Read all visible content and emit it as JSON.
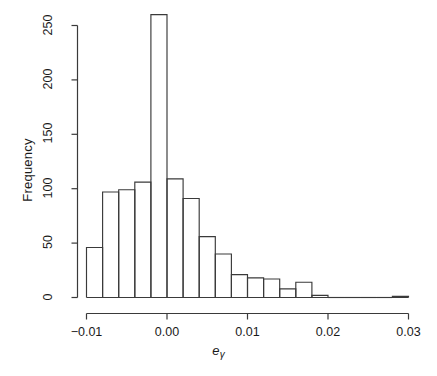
{
  "figure": {
    "background": "#ffffff",
    "ink_color": "#3a3a3a",
    "text_color": "#1a1a1a"
  },
  "axis": {
    "y_label": "Frequency",
    "x_label_base": "e",
    "x_label_sub": "γ",
    "y_ticks": [
      "0",
      "50",
      "100",
      "150",
      "200",
      "250"
    ],
    "x_ticks": [
      "-0.01",
      "0.00",
      "0.01",
      "0.02",
      "0.03"
    ]
  },
  "chart_data": {
    "type": "bar",
    "title": "",
    "xlabel": "e_gamma",
    "ylabel": "Frequency",
    "grid": false,
    "legend": "none",
    "bin_width": 0.002,
    "xlim": [
      -0.0105,
      0.0305
    ],
    "ylim": [
      0,
      262
    ],
    "x_tick_values": [
      -0.01,
      0.0,
      0.01,
      0.02,
      0.03
    ],
    "y_tick_values": [
      0,
      50,
      100,
      150,
      200,
      250
    ],
    "bin_edges": [
      -0.01,
      -0.008,
      -0.006,
      -0.004,
      -0.002,
      0.0,
      0.002,
      0.004,
      0.006,
      0.008,
      0.01,
      0.012,
      0.014,
      0.016,
      0.018,
      0.02,
      0.022,
      0.024,
      0.026,
      0.028,
      0.03
    ],
    "categories": [
      "-0.010 to -0.008",
      "-0.008 to -0.006",
      "-0.006 to -0.004",
      "-0.004 to -0.002",
      "-0.002 to 0.000",
      "0.000 to 0.002",
      "0.002 to 0.004",
      "0.004 to 0.006",
      "0.006 to 0.008",
      "0.008 to 0.010",
      "0.010 to 0.012",
      "0.012 to 0.014",
      "0.014 to 0.016",
      "0.016 to 0.018",
      "0.018 to 0.020",
      "0.020 to 0.022",
      "0.022 to 0.024",
      "0.024 to 0.026",
      "0.026 to 0.028",
      "0.028 to 0.030"
    ],
    "values": [
      46,
      97,
      99,
      106,
      260,
      109,
      91,
      56,
      40,
      21,
      18,
      17,
      8,
      14,
      2,
      0,
      0,
      0,
      0,
      1
    ]
  }
}
